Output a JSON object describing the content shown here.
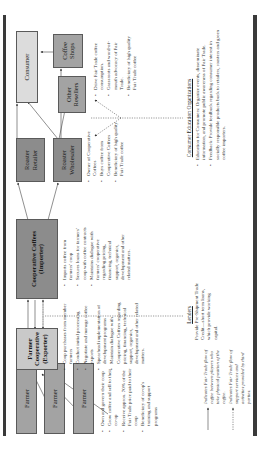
{
  "diagram": {
    "orientation": "rotated-90-ccw",
    "nodes": {
      "farmer_1": "Farmer",
      "farmer_2": "Farmer",
      "farmer_3": "Farmer",
      "farmer_coop": "Farmer Cooperative (Exporter)",
      "coop_coffees": "Cooperative Coffees (Importer)",
      "roaster_retailer": "Roaster Retailer",
      "roaster_wholesaler": "Roaster Wholesaler",
      "other_resellers": "Other Resellers",
      "coffee_shops": "Coffee Shops",
      "consumer": "Consumer"
    },
    "farmer_bullets": [
      "Own and govern their coop",
      "Grow coffee and sell to their co-op",
      "Receive approx. 70% of the Fair Trade price paid to their coop",
      "Beneficiary of co-op's training and support programs"
    ],
    "coop_exporter_bullets": [
      "Coop purchases from member farmers",
      "Conduct initial processing",
      "Negotiate and manage coffee exports",
      "Spearhead implementation of development programs",
      "Maintain dialogue with Cooperative Coffees regarding pricing, financing, technical support, organics, development and other related matters."
    ],
    "importer_bullets": [
      "Imports coffee from farmers' coop",
      "Secures loans for farmers' coop with coffee contracts",
      "Maintains dialogue with farmers' cooperative regarding pricing, financing, technical support, organics, development and other related matters."
    ],
    "roaster_bullets": [
      "Owner of Cooperative Coffees",
      "Buys coffee from Cooperative Coffees",
      "Beneficiary of high quality Fair Trade coffee"
    ],
    "consumer_bullets": [
      "Drive Fair Trade coffee consumption.",
      "Grassroots and word-of-mouth advocacy of Fair Trade.",
      "Beneficiary of high quality Fair Trade coffee"
    ],
    "lenders": {
      "heading": "Lenders",
      "text": "Provide Pre-Shipment Trade Credit—short term loans, which provide working capital."
    },
    "consumer_education": {
      "heading": "Consumer Education Organizations",
      "items": [
        "Education for Consumers: Organize events, disseminate information, and promote public awareness of Fair Trade.",
        "Feedback: Provide feedback regarding consumer interest in socially responsible products back to retailers, roasters and green coffee importers."
      ]
    },
    "legend": [
      {
        "line": "solid",
        "text": "Indicates Fair Trade flow of coffee between players who take physical position of the coffee."
      },
      {
        "line": "dotted",
        "text": "Indicates Fair Trade flow of support services and activities provided by third parties."
      }
    ],
    "colors": {
      "frame_bar": "#3a3a3a",
      "box_dark": "#8c8c8c",
      "box_mid": "#a3a3a3",
      "box_light": "#c9c9c9",
      "box_lighter": "#dcdcdc"
    }
  }
}
